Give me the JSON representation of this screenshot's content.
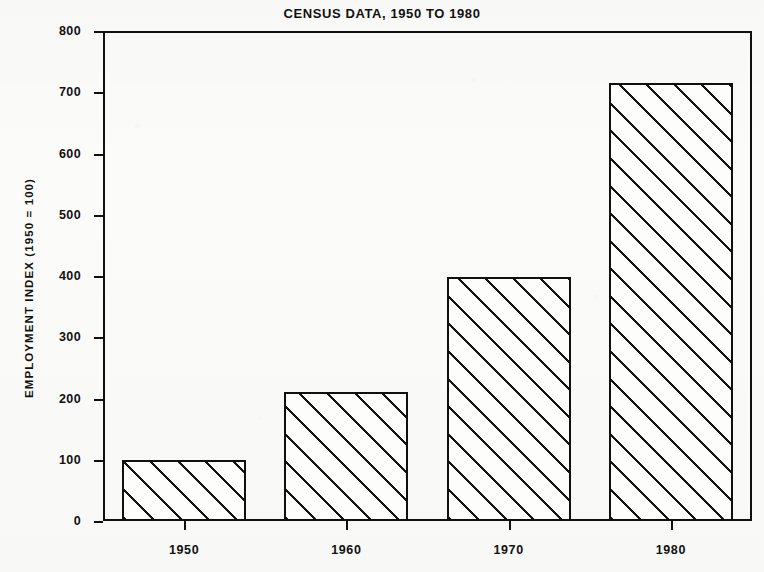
{
  "chart_data": {
    "type": "bar",
    "title": "CENSUS DATA, 1950 TO 1980",
    "xlabel": "",
    "ylabel": "EMPLOYMENT INDEX (1950 = 100)",
    "categories": [
      "1950",
      "1960",
      "1970",
      "1980"
    ],
    "values": [
      100,
      210,
      398,
      715
    ],
    "ylim": [
      0,
      800
    ],
    "ytick_values": [
      0,
      100,
      200,
      300,
      400,
      500,
      600,
      700,
      800
    ],
    "ytick_labels": [
      "0",
      "100",
      "200",
      "300",
      "400",
      "500",
      "600",
      "700",
      "800"
    ],
    "grid": false,
    "legend": null,
    "series": [
      {
        "name": "Employment Index",
        "values": [
          100,
          210,
          398,
          715
        ]
      }
    ],
    "bar_fill": "diagonal-hatch",
    "colors": {
      "ink": "#101010",
      "paper": "#fbfbf9",
      "bar_fill": "#fdfdfb"
    }
  }
}
